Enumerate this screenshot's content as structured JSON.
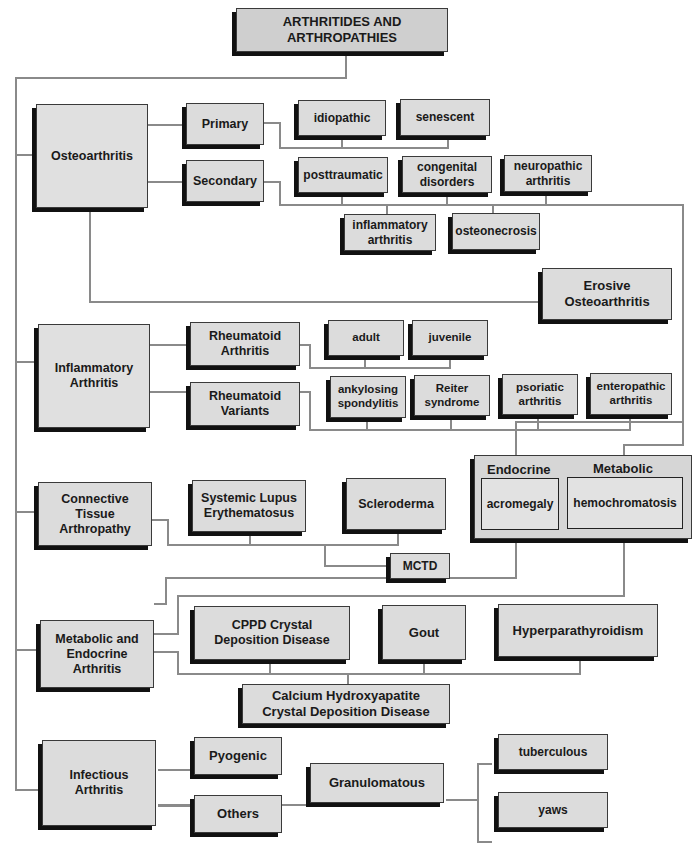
{
  "title": "ARTHRITIDES AND\nARTHROPATHIES",
  "categories": {
    "osteoarthritis": {
      "label": "Osteoarthritis",
      "primary": {
        "label": "Primary",
        "children": [
          "idiopathic",
          "senescent"
        ]
      },
      "secondary": {
        "label": "Secondary",
        "children": [
          "posttraumatic",
          "congenital\ndisorders",
          "neuropathic\narthritis",
          "inflammatory\narthritis",
          "osteonecrosis"
        ]
      },
      "erosive": "Erosive\nOsteoarthritis"
    },
    "inflammatory": {
      "label": "Inflammatory\nArthritis",
      "rheumatoid": {
        "label": "Rheumatoid\nArthritis",
        "children": [
          "adult",
          "juvenile"
        ]
      },
      "variants": {
        "label": "Rheumatoid\nVariants",
        "children": [
          "ankylosing\nspondylitis",
          "Reiter\nsyndrome",
          "psoriatic\narthritis",
          "enteropathic\narthritis"
        ]
      }
    },
    "connective": {
      "label": "Connective\nTissue\nArthropathy",
      "children": [
        "Systemic Lupus\nErythematosus",
        "Scleroderma",
        "MCTD"
      ]
    },
    "endocrine_metabolic_group": {
      "endocrine_header": "Endocrine",
      "metabolic_header": "Metabolic",
      "endocrine_item": "acromegaly",
      "metabolic_item": "hemochromatosis"
    },
    "metabolic_endocrine": {
      "label": "Metabolic and\nEndocrine\nArthritis",
      "children": [
        "CPPD Crystal\nDeposition Disease",
        "Gout",
        "Hyperparathyroidism",
        "Calcium Hydroxyapatite\nCrystal Deposition Disease"
      ]
    },
    "infectious": {
      "label": "Infectious\nArthritis",
      "pyogenic": "Pyogenic",
      "others": "Others",
      "granulomatous": {
        "label": "Granulomatous",
        "children": [
          "tuberculous",
          "yaws"
        ]
      }
    }
  }
}
